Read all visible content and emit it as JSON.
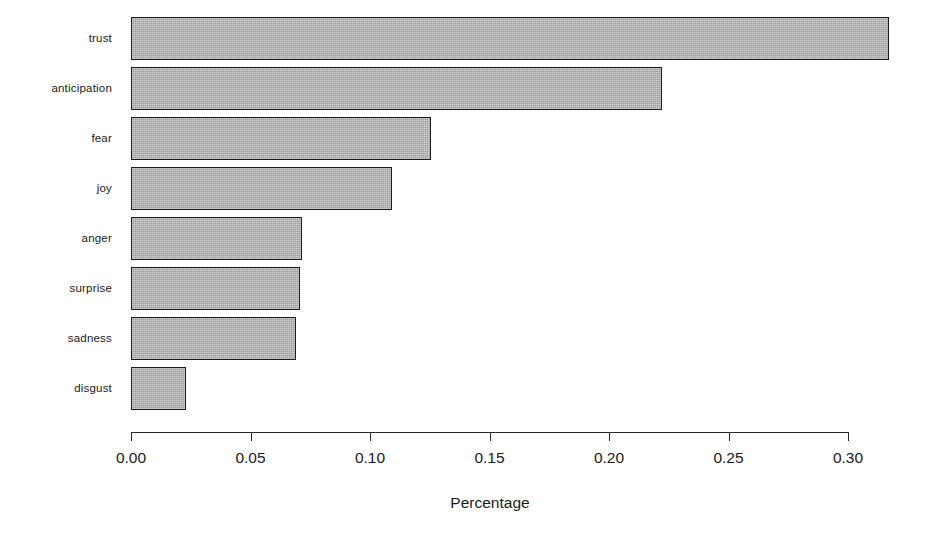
{
  "chart_data": {
    "type": "bar",
    "orientation": "horizontal",
    "title": "",
    "subtitle": "",
    "xlabel": "Percentage",
    "ylabel": "",
    "categories": [
      "trust",
      "anticipation",
      "fear",
      "joy",
      "anger",
      "surprise",
      "sadness",
      "disgust"
    ],
    "values": [
      0.317,
      0.222,
      0.1255,
      0.109,
      0.0715,
      0.0707,
      0.069,
      0.023
    ],
    "xlim": [
      0.0,
      0.3175
    ],
    "xticks": [
      0.0,
      0.05,
      0.1,
      0.15,
      0.2,
      0.25,
      0.3
    ],
    "xtick_labels": [
      "0.00",
      "0.05",
      "0.10",
      "0.15",
      "0.20",
      "0.25",
      "0.30"
    ],
    "grid": false,
    "legend": null,
    "bar_fill_color": "#9c9c9c",
    "bar_border_color": "#1b1b1b",
    "axis_color": "#2a2a2a",
    "background_color": "#ffffff"
  }
}
